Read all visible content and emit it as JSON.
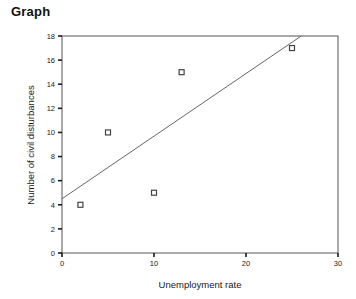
{
  "title": "Graph",
  "chart_data": {
    "type": "scatter",
    "title": "Graph",
    "xlabel": "Unemployment rate",
    "ylabel": "Number of civil disturbances",
    "xlim": [
      0,
      30
    ],
    "ylim": [
      0,
      18
    ],
    "xticks": [
      0,
      10,
      20,
      30
    ],
    "yticks": [
      0,
      2,
      4,
      6,
      8,
      10,
      12,
      14,
      16,
      18
    ],
    "xtick_labels": [
      "0",
      "10",
      "20",
      "30"
    ],
    "ytick_labels": [
      "0",
      "2",
      "4",
      "6",
      "8",
      "10",
      "12",
      "14",
      "16",
      "18"
    ],
    "grid": false,
    "legend": null,
    "marker": "open-square",
    "points": [
      {
        "x": 2,
        "y": 4
      },
      {
        "x": 5,
        "y": 10
      },
      {
        "x": 10,
        "y": 5
      },
      {
        "x": 13,
        "y": 15
      },
      {
        "x": 25,
        "y": 17
      }
    ],
    "trendline": {
      "type": "linear",
      "x0": 0,
      "y0": 4.5,
      "x1": 26,
      "y1": 18
    }
  }
}
